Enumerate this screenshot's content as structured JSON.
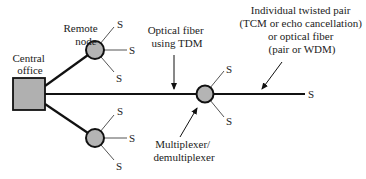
{
  "diagram": {
    "colors": {
      "line": "#111111",
      "node_fill": "#b4b4b4",
      "office_fill": "#b0b0b0",
      "text": "#222222"
    },
    "labels": {
      "central_office_line1": "Central",
      "central_office_line2": "office",
      "remote_node_line1": "Remote",
      "remote_node_line2": "node",
      "optical_fiber_line1": "Optical fiber",
      "optical_fiber_line2": "using TDM",
      "twisted_pair_line1": "Individual twisted pair",
      "twisted_pair_line2": "(TCM or echo cancellation)",
      "twisted_pair_line3": "or optical fiber",
      "twisted_pair_line4": "(pair or WDM)",
      "mux_line1": "Multiplexer/",
      "mux_line2": "demultiplexer",
      "subscriber": "S"
    },
    "nodes": [
      {
        "id": "central-office",
        "type": "square"
      },
      {
        "id": "remote-node-upper",
        "type": "circle"
      },
      {
        "id": "remote-node-lower",
        "type": "circle"
      },
      {
        "id": "multiplexer-node",
        "type": "circle"
      }
    ]
  }
}
